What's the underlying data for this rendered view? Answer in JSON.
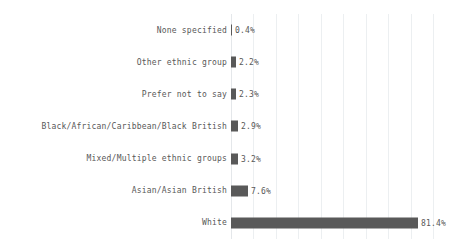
{
  "chart_data": {
    "type": "bar",
    "orientation": "horizontal",
    "title": "",
    "subtitle": "",
    "xlabel": "",
    "ylabel": "",
    "categories": [
      "None specified",
      "Other ethnic group",
      "Prefer not to say",
      "Black/African/Caribbean/Black British",
      "Mixed/Multiple ethnic groups",
      "Asian/Asian British",
      "White"
    ],
    "values": [
      0.4,
      2.2,
      2.3,
      2.9,
      3.2,
      7.6,
      81.4
    ],
    "value_labels": [
      "0.4%",
      "2.2%",
      "2.3%",
      "2.9%",
      "3.2%",
      "7.6%",
      "81.4%"
    ],
    "xlim": [
      0,
      88
    ],
    "ylim": [
      0,
      7
    ],
    "grid": true,
    "grid_axis": "x",
    "gridline_count": 10,
    "legend": false,
    "legend_position": "none",
    "xticklabels": [],
    "yticklabels": [
      "None specified",
      "Other ethnic group",
      "Prefer not to say",
      "Black/African/Caribbean/Black British",
      "Mixed/Multiple ethnic groups",
      "Asian/Asian British",
      "White"
    ],
    "series": [
      {
        "name": "Percentage",
        "values": [
          0.4,
          2.2,
          2.3,
          2.9,
          3.2,
          7.6,
          81.4
        ]
      }
    ],
    "colors": {
      "bar": "#595959",
      "gridline": "#eceff1",
      "axis": "#e4e7ea",
      "text": "#585858",
      "background": "#ffffff"
    }
  }
}
